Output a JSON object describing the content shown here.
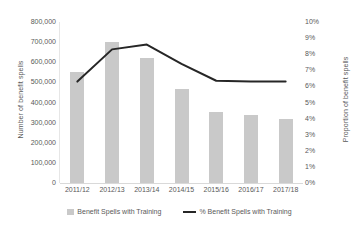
{
  "chart_data": {
    "type": "bar",
    "title": "",
    "subtitle": "",
    "xlabel": "",
    "ylabel": "Number of benefit spells",
    "y2label": "Proportion of benefit spells",
    "categories": [
      "2011/12",
      "2012/13",
      "2013/14",
      "2014/15",
      "2015/16",
      "2016/17",
      "2017/18"
    ],
    "ylim": [
      0,
      800000
    ],
    "y2lim": [
      0,
      0.1
    ],
    "yticks": [
      "0",
      "100,000",
      "200,000",
      "300,000",
      "400,000",
      "500,000",
      "600,000",
      "700,000",
      "800,000"
    ],
    "ytick_values": [
      0,
      100000,
      200000,
      300000,
      400000,
      500000,
      600000,
      700000,
      800000
    ],
    "y2ticks": [
      "0%",
      "1%",
      "2%",
      "3%",
      "4%",
      "5%",
      "6%",
      "7%",
      "8%",
      "9%",
      "10%"
    ],
    "y2tick_values": [
      0,
      1,
      2,
      3,
      4,
      5,
      6,
      7,
      8,
      9,
      10
    ],
    "grid": false,
    "legend_position": "bottom",
    "series": [
      {
        "name": "Benefit Spells with Training",
        "type": "bar",
        "axis": "left",
        "color": "#c9c9c9",
        "values": [
          550000,
          700000,
          620000,
          465000,
          355000,
          340000,
          320000
        ]
      },
      {
        "name": "% Benefit Spells with Training",
        "type": "line",
        "axis": "right",
        "color": "#262626",
        "values": [
          6.3,
          8.3,
          8.6,
          7.4,
          6.35,
          6.3,
          6.3
        ]
      }
    ]
  },
  "legend": {
    "items": [
      {
        "label": "Benefit Spells with Training",
        "marker": "bar-swatch"
      },
      {
        "label": "% Benefit Spells with Training",
        "marker": "line-swatch"
      }
    ]
  }
}
